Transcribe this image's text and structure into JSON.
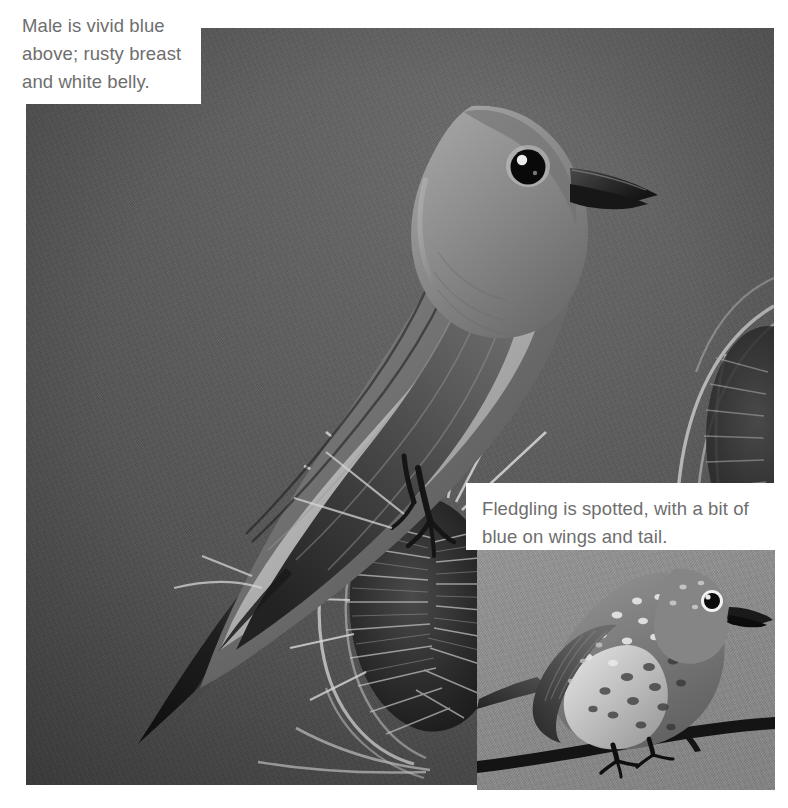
{
  "page": {
    "width": 788,
    "height": 808,
    "background": "#ffffff",
    "kind": "field-guide-photo-plate"
  },
  "captions": {
    "male": {
      "id": "caption-male",
      "text": "Male is vivid blue above; rusty breast and white belly.",
      "lines": [
        "Male is vivid blue",
        "above; rusty breast",
        "and white belly."
      ],
      "text_color": "#6e6e6e",
      "box_color": "#ffffff"
    },
    "fledgling": {
      "id": "caption-fledgling",
      "text": "Fledgling is spotted, with a bit of blue on wings and tail.",
      "lines": [
        "Fledgling is spotted, with a bit of",
        "blue on wings and tail."
      ],
      "text_color": "#6e6e6e",
      "box_color": "#ffffff"
    }
  },
  "photos": {
    "main": {
      "name": "adult-male-bluebird-photo",
      "subject": "Adult male bluebird perched on dried teasel seed head",
      "background_color": "#565656",
      "rect": {
        "x": 26,
        "y": 28,
        "w": 748,
        "h": 757
      },
      "elements": [
        "bird",
        "teasel-seedhead",
        "teasel-bracts"
      ]
    },
    "inset": {
      "name": "fledgling-bluebird-photo",
      "subject": "Spotted fledgling bluebird perched on a bare branch",
      "background_color": "#8b8b8b",
      "rect": {
        "x": 477,
        "y": 549,
        "w": 298,
        "h": 241
      },
      "elements": [
        "fledgling-bird",
        "branch"
      ]
    }
  },
  "colors": {
    "page_background": "#ffffff",
    "main_photo_background": "#565656",
    "inset_photo_background": "#8b8b8b",
    "caption_text": "#6e6e6e",
    "caption_background": "#ffffff"
  }
}
